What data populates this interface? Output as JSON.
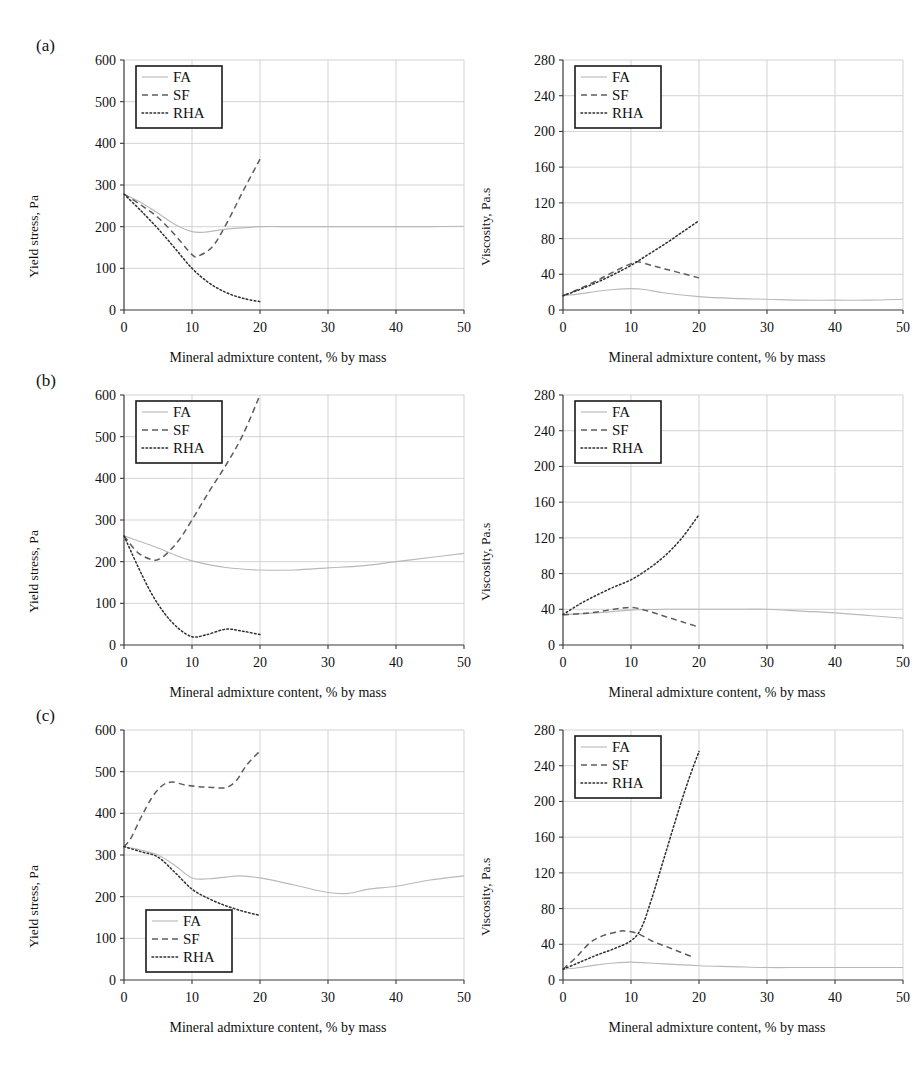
{
  "figure": {
    "panels": [
      {
        "letter": "(a)",
        "charts": [
          {
            "chart_key": "a_yield",
            "ylabel": "Yield stress, Pa",
            "xlabel": "Mineral admixture content, % by mass",
            "legend_position": "top-left"
          },
          {
            "chart_key": "a_visc",
            "ylabel": "Viscosity, Pa.s",
            "xlabel": "Mineral admixture content, % by mass",
            "legend_position": "top-left"
          }
        ]
      },
      {
        "letter": "(b)",
        "charts": [
          {
            "chart_key": "b_yield",
            "ylabel": "Yield stress, Pa",
            "xlabel": "Mineral admixture content, % by mass",
            "legend_position": "top-left"
          },
          {
            "chart_key": "b_visc",
            "ylabel": "Viscosity, Pa.s",
            "xlabel": "Mineral admixture content, % by mass",
            "legend_position": "top-left"
          }
        ]
      },
      {
        "letter": "(c)",
        "charts": [
          {
            "chart_key": "c_yield",
            "ylabel": "Yield stress, Pa",
            "xlabel": "Mineral admixture content, % by mass",
            "legend_position": "bottom-left"
          },
          {
            "chart_key": "c_visc",
            "ylabel": "Viscosity, Pa.s",
            "xlabel": "Mineral admixture content, % by mass",
            "legend_position": "top-left"
          }
        ]
      }
    ],
    "legend_entries": [
      "FA",
      "SF",
      "RHA"
    ],
    "colors": {
      "FA": "#b9b9b9",
      "SF": "#5d5d5d",
      "RHA": "#2e2e2e",
      "grid": "#c8c8c8",
      "axis": "#3a3a3a"
    }
  },
  "chart_data": [
    {
      "key": "a_yield",
      "type": "line",
      "title": "(a) Yield stress",
      "xlabel": "Mineral admixture content, % by mass",
      "ylabel": "Yield stress, Pa",
      "xlim": [
        0,
        50
      ],
      "ylim": [
        0,
        600
      ],
      "xticks": [
        0,
        10,
        20,
        30,
        40,
        50
      ],
      "yticks": [
        0,
        100,
        200,
        300,
        400,
        500,
        600
      ],
      "grid": true,
      "legend": [
        "FA",
        "SF",
        "RHA"
      ],
      "legend_position": "top-left",
      "series": [
        {
          "name": "FA",
          "x": [
            0,
            2.5,
            5,
            7.5,
            10,
            12,
            15,
            20,
            25,
            30,
            35,
            40,
            45,
            50
          ],
          "y": [
            278,
            258,
            232,
            205,
            188,
            187,
            194,
            200,
            200,
            200,
            200,
            200,
            200,
            201
          ]
        },
        {
          "name": "SF",
          "x": [
            0,
            2.5,
            5,
            7.5,
            10,
            11,
            13,
            15,
            17.5,
            20
          ],
          "y": [
            278,
            252,
            222,
            180,
            133,
            130,
            152,
            205,
            285,
            362
          ]
        },
        {
          "name": "RHA",
          "x": [
            0,
            2.5,
            5,
            7.5,
            10,
            12.5,
            15,
            17.5,
            20
          ],
          "y": [
            278,
            238,
            195,
            148,
            100,
            65,
            42,
            28,
            20
          ]
        }
      ]
    },
    {
      "key": "a_visc",
      "type": "line",
      "title": "(a) Viscosity",
      "xlabel": "Mineral admixture content, % by mass",
      "ylabel": "Viscosity, Pa.s",
      "xlim": [
        0,
        50
      ],
      "ylim": [
        0,
        280
      ],
      "xticks": [
        0,
        10,
        20,
        30,
        40,
        50
      ],
      "yticks": [
        0,
        40,
        80,
        120,
        160,
        200,
        240,
        280
      ],
      "grid": true,
      "legend": [
        "FA",
        "SF",
        "RHA"
      ],
      "legend_position": "top-left",
      "series": [
        {
          "name": "FA",
          "x": [
            0,
            2.5,
            5,
            7.5,
            10,
            12,
            15,
            20,
            25,
            30,
            35,
            40,
            45,
            50
          ],
          "y": [
            16,
            18,
            21,
            23,
            24,
            23,
            19,
            15,
            13,
            12,
            11,
            11,
            11,
            12
          ]
        },
        {
          "name": "SF",
          "x": [
            0,
            2.5,
            5,
            7.5,
            10,
            11,
            13,
            15,
            17.5,
            20
          ],
          "y": [
            16,
            24,
            33,
            43,
            52,
            54,
            50,
            46,
            41,
            36
          ]
        },
        {
          "name": "RHA",
          "x": [
            0,
            2.5,
            5,
            7.5,
            10,
            12.5,
            15,
            17.5,
            20
          ],
          "y": [
            16,
            23,
            31,
            40,
            50,
            62,
            74,
            87,
            100
          ]
        }
      ]
    },
    {
      "key": "b_yield",
      "type": "line",
      "title": "(b) Yield stress",
      "xlabel": "Mineral admixture content, % by mass",
      "ylabel": "Yield stress, Pa",
      "xlim": [
        0,
        50
      ],
      "ylim": [
        0,
        600
      ],
      "xticks": [
        0,
        10,
        20,
        30,
        40,
        50
      ],
      "yticks": [
        0,
        100,
        200,
        300,
        400,
        500,
        600
      ],
      "grid": true,
      "legend": [
        "FA",
        "SF",
        "RHA"
      ],
      "legend_position": "top-left",
      "series": [
        {
          "name": "FA",
          "x": [
            0,
            2.5,
            5,
            7.5,
            10,
            15,
            20,
            25,
            30,
            35,
            40,
            45,
            50
          ],
          "y": [
            262,
            248,
            233,
            216,
            202,
            186,
            180,
            180,
            185,
            190,
            200,
            210,
            220
          ]
        },
        {
          "name": "SF",
          "x": [
            0,
            2,
            4,
            5,
            6,
            8,
            10,
            12.5,
            15,
            17.5,
            20
          ],
          "y": [
            262,
            222,
            205,
            205,
            215,
            250,
            300,
            368,
            432,
            505,
            600
          ]
        },
        {
          "name": "RHA",
          "x": [
            0,
            2,
            4,
            6,
            8,
            10,
            12,
            15,
            17.5,
            20
          ],
          "y": [
            262,
            190,
            125,
            75,
            40,
            20,
            24,
            38,
            33,
            25
          ]
        }
      ]
    },
    {
      "key": "b_visc",
      "type": "line",
      "title": "(b) Viscosity",
      "xlabel": "Mineral admixture content, % by mass",
      "ylabel": "Viscosity, Pa.s",
      "xlim": [
        0,
        50
      ],
      "ylim": [
        0,
        280
      ],
      "xticks": [
        0,
        10,
        20,
        30,
        40,
        50
      ],
      "yticks": [
        0,
        40,
        80,
        120,
        160,
        200,
        240,
        280
      ],
      "grid": true,
      "legend": [
        "FA",
        "SF",
        "RHA"
      ],
      "legend_position": "top-left",
      "series": [
        {
          "name": "FA",
          "x": [
            0,
            5,
            10,
            15,
            20,
            25,
            30,
            35,
            40,
            45,
            50
          ],
          "y": [
            34,
            36,
            39,
            40,
            40,
            40,
            40,
            38,
            36,
            33,
            30
          ]
        },
        {
          "name": "SF",
          "x": [
            0,
            2.5,
            5,
            7.5,
            10,
            12.5,
            15,
            17.5,
            20
          ],
          "y": [
            34,
            35,
            37,
            40,
            42,
            38,
            32,
            26,
            20
          ]
        },
        {
          "name": "RHA",
          "x": [
            0,
            2.5,
            5,
            7.5,
            10,
            12.5,
            15,
            17.5,
            20
          ],
          "y": [
            34,
            46,
            56,
            65,
            73,
            85,
            100,
            120,
            146
          ]
        }
      ]
    },
    {
      "key": "c_yield",
      "type": "line",
      "title": "(c) Yield stress",
      "xlabel": "Mineral admixture content, % by mass",
      "ylabel": "Yield stress, Pa",
      "xlim": [
        0,
        50
      ],
      "ylim": [
        0,
        600
      ],
      "xticks": [
        0,
        10,
        20,
        30,
        40,
        50
      ],
      "yticks": [
        0,
        100,
        200,
        300,
        400,
        500,
        600
      ],
      "grid": true,
      "legend": [
        "FA",
        "SF",
        "RHA"
      ],
      "legend_position": "bottom-left",
      "series": [
        {
          "name": "FA",
          "x": [
            0,
            2.5,
            5,
            7.5,
            10,
            12.5,
            15,
            17,
            20,
            25,
            30,
            33,
            36,
            40,
            45,
            50
          ],
          "y": [
            320,
            312,
            300,
            275,
            245,
            243,
            247,
            250,
            245,
            228,
            210,
            208,
            218,
            225,
            240,
            250
          ]
        },
        {
          "name": "SF",
          "x": [
            0,
            1,
            2.5,
            4,
            5.5,
            7,
            9,
            11,
            13,
            15,
            16.5,
            18,
            20
          ],
          "y": [
            320,
            340,
            390,
            435,
            465,
            475,
            468,
            464,
            462,
            462,
            478,
            515,
            550
          ]
        },
        {
          "name": "RHA",
          "x": [
            0,
            2.5,
            5,
            7.5,
            10,
            12.5,
            15,
            17.5,
            20
          ],
          "y": [
            320,
            308,
            295,
            258,
            218,
            195,
            178,
            165,
            155
          ]
        }
      ]
    },
    {
      "key": "c_visc",
      "type": "line",
      "title": "(c) Viscosity",
      "xlabel": "Mineral admixture content, % by mass",
      "ylabel": "Viscosity, Pa.s",
      "xlim": [
        0,
        50
      ],
      "ylim": [
        0,
        280
      ],
      "xticks": [
        0,
        10,
        20,
        30,
        40,
        50
      ],
      "yticks": [
        0,
        40,
        80,
        120,
        160,
        200,
        240,
        280
      ],
      "grid": true,
      "legend": [
        "FA",
        "SF",
        "RHA"
      ],
      "legend_position": "top-left",
      "series": [
        {
          "name": "FA",
          "x": [
            0,
            2.5,
            5,
            7.5,
            10,
            12.5,
            15,
            20,
            25,
            30,
            35,
            40,
            45,
            50
          ],
          "y": [
            12,
            14,
            17,
            19,
            20,
            19,
            18,
            16,
            15,
            14,
            14,
            14,
            14,
            14
          ]
        },
        {
          "name": "SF",
          "x": [
            0,
            2,
            4,
            6,
            8,
            9,
            11,
            13,
            15,
            17,
            19
          ],
          "y": [
            12,
            26,
            42,
            50,
            54,
            55,
            52,
            44,
            38,
            32,
            26
          ]
        },
        {
          "name": "RHA",
          "x": [
            0,
            2.5,
            5,
            7.5,
            10,
            11.5,
            13,
            15,
            17,
            18.5,
            20
          ],
          "y": [
            12,
            20,
            28,
            35,
            44,
            58,
            90,
            140,
            190,
            225,
            256
          ]
        }
      ]
    }
  ]
}
